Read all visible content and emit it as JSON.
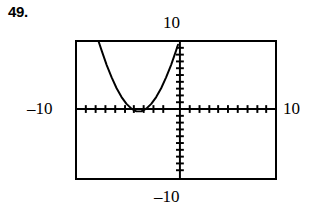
{
  "exercise": {
    "number": "49."
  },
  "labels": {
    "y_max": "10",
    "y_min": "–10",
    "x_min": "–10",
    "x_max": "10"
  },
  "colors": {
    "ink": "#000000",
    "background": "#ffffff"
  },
  "chart_data": {
    "type": "line",
    "title": "",
    "subtitle": "",
    "xlabel": "",
    "ylabel": "",
    "xlim": [
      -10,
      10
    ],
    "ylim": [
      -10,
      10
    ],
    "grid": false,
    "legend": "none",
    "axis_ticks": {
      "x_tick_spacing": 1,
      "y_tick_spacing": 1,
      "x_tick_values": [
        -9,
        -8,
        -7,
        -6,
        -5,
        -4,
        -3,
        -2,
        -1,
        1,
        2,
        3,
        4,
        5,
        6,
        7,
        8,
        9
      ],
      "y_tick_values": [
        -9,
        -8,
        -7,
        -6,
        -5,
        -4,
        -3,
        -2,
        -1,
        1,
        2,
        3,
        4,
        5,
        6,
        7,
        8,
        9
      ]
    },
    "annotations": [
      "viewing window [-10, 10] by [-10, 10]",
      "upward-opening parabola, vertex just below x-axis near x = -4"
    ],
    "series": [
      {
        "name": "parabola",
        "x": [
          -7.8,
          -7.5,
          -7.0,
          -6.5,
          -6.0,
          -5.5,
          -5.0,
          -4.5,
          -4.0,
          -3.5,
          -3.0,
          -2.5,
          -2.0,
          -1.5,
          -1.0,
          -0.5,
          0.0,
          0.2
        ],
        "y": [
          10.0,
          8.7,
          6.6,
          4.8,
          3.2,
          1.9,
          0.9,
          0.2,
          -0.2,
          -0.2,
          0.2,
          0.9,
          1.9,
          3.2,
          4.8,
          6.6,
          8.7,
          9.6
        ]
      }
    ]
  }
}
